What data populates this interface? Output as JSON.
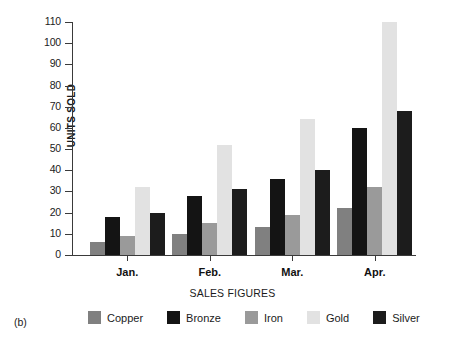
{
  "panel": {
    "label": "(b)"
  },
  "chart_data": {
    "type": "bar",
    "title": "",
    "xlabel": "SALES FIGURES",
    "ylabel": "UNITS SOLD",
    "categories": [
      "Jan.",
      "Feb.",
      "Mar.",
      "Apr."
    ],
    "yticks": [
      0,
      10,
      20,
      30,
      40,
      50,
      60,
      70,
      80,
      90,
      100,
      110
    ],
    "ylim": [
      0,
      110
    ],
    "grid": false,
    "legend_position": "bottom",
    "series": [
      {
        "name": "Copper",
        "color": "#808080",
        "values": [
          6,
          10,
          13,
          22
        ]
      },
      {
        "name": "Bronze",
        "color": "#141414",
        "values": [
          18,
          28,
          36,
          60
        ]
      },
      {
        "name": "Iron",
        "color": "#9a9a9a",
        "values": [
          9,
          15,
          19,
          32
        ]
      },
      {
        "name": "Gold",
        "color": "#e2e2e2",
        "values": [
          32,
          52,
          64,
          110
        ]
      },
      {
        "name": "Silver",
        "color": "#1c1c1c",
        "values": [
          20,
          31,
          40,
          68
        ]
      }
    ]
  }
}
